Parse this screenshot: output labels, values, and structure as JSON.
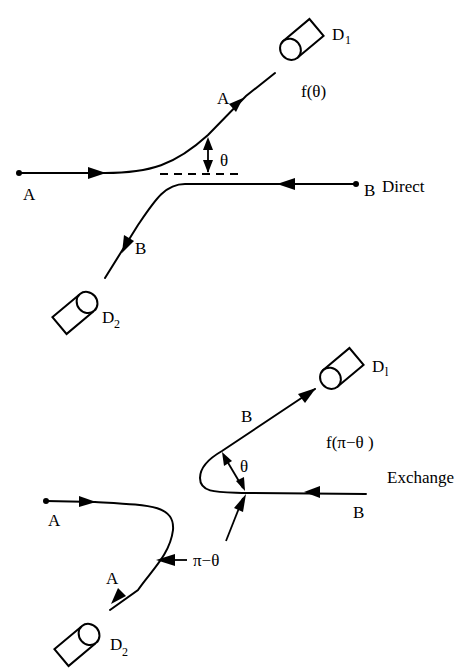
{
  "diagram": {
    "direct": {
      "label": "Direct",
      "amplitude": "f(θ)",
      "angle": "θ",
      "particle_a_start": "A",
      "particle_b_start": "B",
      "particle_a_out": "A",
      "particle_b_out": "B",
      "detector_1": "D",
      "detector_1_sub": "1",
      "detector_2": "D",
      "detector_2_sub": "2"
    },
    "exchange": {
      "label": "Exchange",
      "amplitude": "f(π−θ )",
      "angle": "θ",
      "angle_supplement": "π−θ",
      "particle_a_start": "A",
      "particle_b_start": "B",
      "particle_b_out": "B",
      "particle_a_out": "A",
      "detector_1": "D",
      "detector_1_sub": "l",
      "detector_2": "D",
      "detector_2_sub": "2"
    }
  }
}
